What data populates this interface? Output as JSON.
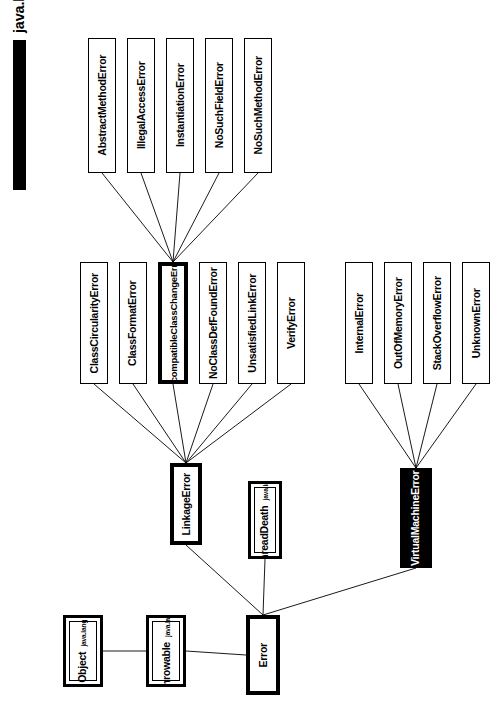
{
  "diagram": {
    "title": "java.lang-errors",
    "version": "1.188",
    "type": "class-hierarchy",
    "orientation": "rotated-90-ccw",
    "root": "Object"
  },
  "nodes": [
    {
      "id": "abstractmethoderror",
      "name": "AbstractMethodError",
      "package": "",
      "style": "plain",
      "x": 88,
      "y": 38,
      "w": 28,
      "h": 135
    },
    {
      "id": "illegalaccesserror",
      "name": "IllegalAccessError",
      "package": "",
      "style": "plain",
      "x": 127,
      "y": 38,
      "w": 28,
      "h": 135
    },
    {
      "id": "instantiationerror",
      "name": "InstantiationError",
      "package": "",
      "style": "plain",
      "x": 166,
      "y": 38,
      "w": 28,
      "h": 135
    },
    {
      "id": "nosuchfielderror",
      "name": "NoSuchFieldError",
      "package": "",
      "style": "plain",
      "x": 205,
      "y": 38,
      "w": 28,
      "h": 135
    },
    {
      "id": "nosuchmethoderror",
      "name": "NoSuchMethodError",
      "package": "",
      "style": "plain",
      "x": 244,
      "y": 38,
      "w": 28,
      "h": 135
    },
    {
      "id": "classcircularityerror",
      "name": "ClassCircularityError",
      "package": "",
      "style": "plain",
      "x": 80,
      "y": 262,
      "w": 28,
      "h": 122
    },
    {
      "id": "classformaterror",
      "name": "ClassFormatError",
      "package": "",
      "style": "plain",
      "x": 119,
      "y": 262,
      "w": 28,
      "h": 122
    },
    {
      "id": "incompatibleclasschangeerror",
      "name": "IncompatibleClassChangeError",
      "package": "",
      "style": "bold",
      "x": 158,
      "y": 262,
      "w": 30,
      "h": 122
    },
    {
      "id": "noclassdeffounderror",
      "name": "NoClassDefFoundError",
      "package": "",
      "style": "plain",
      "x": 199,
      "y": 262,
      "w": 28,
      "h": 122
    },
    {
      "id": "unsatisfiedlinkerror",
      "name": "UnsatisfiedLinkError",
      "package": "",
      "style": "plain",
      "x": 238,
      "y": 262,
      "w": 28,
      "h": 122
    },
    {
      "id": "verifyerror",
      "name": "VerifyError",
      "package": "",
      "style": "plain",
      "x": 277,
      "y": 262,
      "w": 28,
      "h": 122
    },
    {
      "id": "internalerror",
      "name": "InternalError",
      "package": "",
      "style": "plain",
      "x": 345,
      "y": 262,
      "w": 28,
      "h": 122
    },
    {
      "id": "outofmemoryerror",
      "name": "OutOfMemoryError",
      "package": "",
      "style": "plain",
      "x": 384,
      "y": 262,
      "w": 28,
      "h": 122
    },
    {
      "id": "stackoverflowerror",
      "name": "StackOverflowError",
      "package": "",
      "style": "plain",
      "x": 423,
      "y": 262,
      "w": 28,
      "h": 122
    },
    {
      "id": "unknownerror",
      "name": "UnknownError",
      "package": "",
      "style": "plain",
      "x": 462,
      "y": 262,
      "w": 28,
      "h": 122
    },
    {
      "id": "linkageerror",
      "name": "LinkageError",
      "package": "",
      "style": "bold",
      "x": 170,
      "y": 463,
      "w": 32,
      "h": 82
    },
    {
      "id": "threaddeath",
      "name": "ThreadDeath",
      "package": "java.lang",
      "style": "double",
      "x": 248,
      "y": 481,
      "w": 34,
      "h": 78
    },
    {
      "id": "virtualmachineerror",
      "name": "VirtualMachineError",
      "package": "",
      "style": "inverted",
      "x": 400,
      "y": 468,
      "w": 32,
      "h": 100
    },
    {
      "id": "object",
      "name": "Object",
      "package": "java.lang",
      "style": "double",
      "x": 63,
      "y": 615,
      "w": 40,
      "h": 72
    },
    {
      "id": "throwable",
      "name": "Throwable",
      "package": "java.lang",
      "style": "double",
      "x": 146,
      "y": 615,
      "w": 40,
      "h": 72
    },
    {
      "id": "error",
      "name": "Error",
      "package": "",
      "style": "bold",
      "x": 246,
      "y": 615,
      "w": 34,
      "h": 80
    }
  ],
  "edges": [
    {
      "from": "abstractmethoderror",
      "to": "incompatibleclasschangeerror"
    },
    {
      "from": "illegalaccesserror",
      "to": "incompatibleclasschangeerror"
    },
    {
      "from": "instantiationerror",
      "to": "incompatibleclasschangeerror"
    },
    {
      "from": "nosuchfielderror",
      "to": "incompatibleclasschangeerror"
    },
    {
      "from": "nosuchmethoderror",
      "to": "incompatibleclasschangeerror"
    },
    {
      "from": "classcircularityerror",
      "to": "linkageerror"
    },
    {
      "from": "classformaterror",
      "to": "linkageerror"
    },
    {
      "from": "incompatibleclasschangeerror",
      "to": "linkageerror"
    },
    {
      "from": "noclassdeffounderror",
      "to": "linkageerror"
    },
    {
      "from": "unsatisfiedlinkerror",
      "to": "linkageerror"
    },
    {
      "from": "verifyerror",
      "to": "linkageerror"
    },
    {
      "from": "internalerror",
      "to": "virtualmachineerror"
    },
    {
      "from": "outofmemoryerror",
      "to": "virtualmachineerror"
    },
    {
      "from": "stackoverflowerror",
      "to": "virtualmachineerror"
    },
    {
      "from": "unknownerror",
      "to": "virtualmachineerror"
    },
    {
      "from": "linkageerror",
      "to": "error"
    },
    {
      "from": "threaddeath",
      "to": "error"
    },
    {
      "from": "virtualmachineerror",
      "to": "error"
    },
    {
      "from": "object",
      "to": "throwable"
    },
    {
      "from": "throwable",
      "to": "error"
    }
  ]
}
